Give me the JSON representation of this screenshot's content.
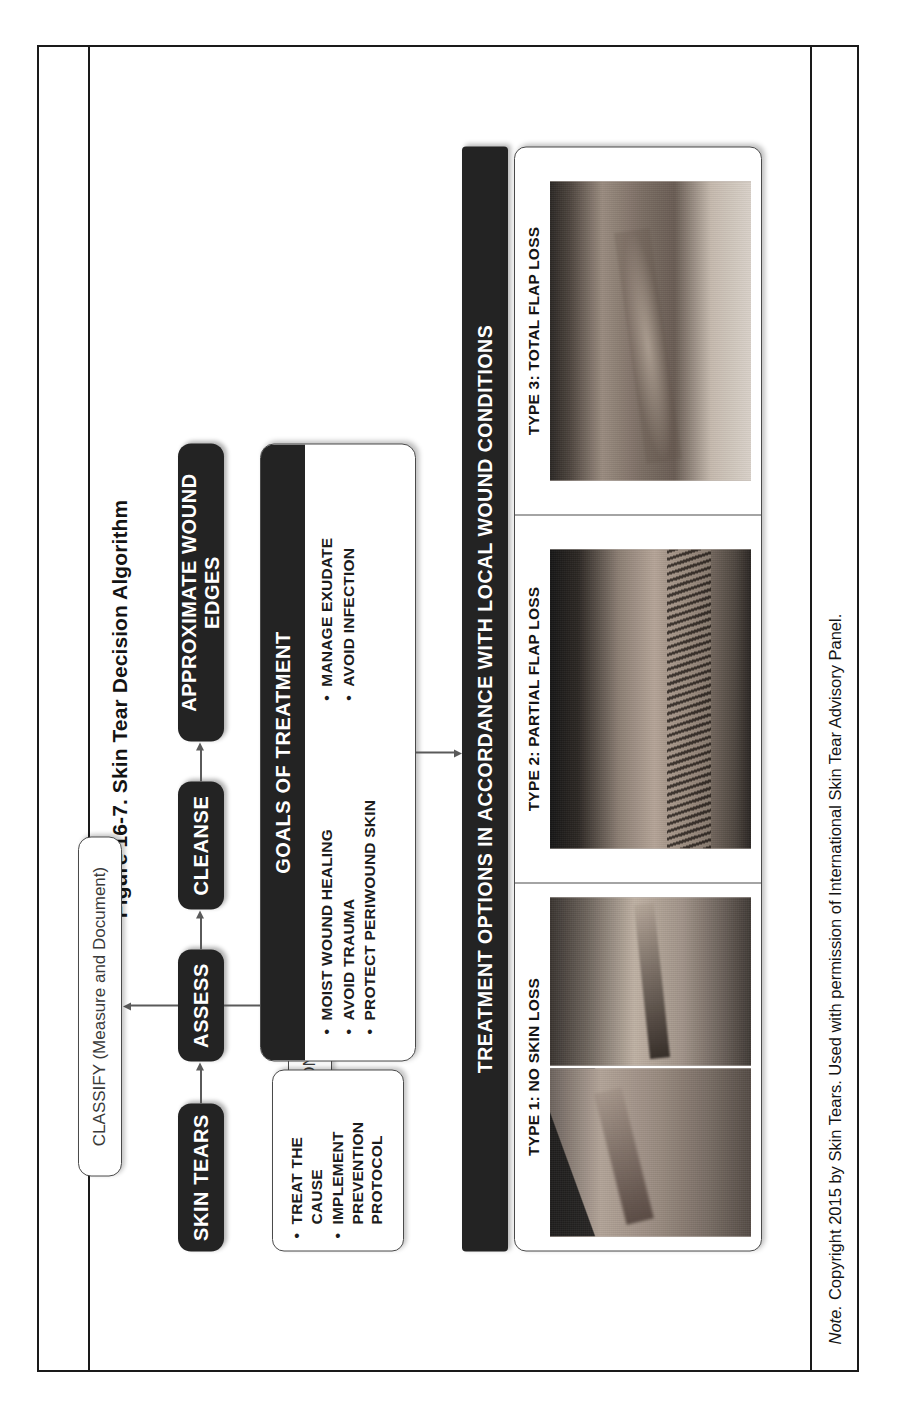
{
  "figure": {
    "title": "Figure 16-7. Skin Tear Decision Algorithm",
    "note_label": "Note.",
    "note_text": "Copyright 2015 by Skin Tears. Used with permission of International Skin Tear Advisory Panel."
  },
  "flow": {
    "start": {
      "label": "SKIN TEARS",
      "style": "dark"
    },
    "assess": {
      "label": "ASSESS",
      "style": "dark"
    },
    "control_bleeding": {
      "label": "CONTROL BLEEDING",
      "style": "light"
    },
    "classify": {
      "label": "CLASSIFY (Measure and Document)",
      "style": "light"
    },
    "cleanse": {
      "label": "CLEANSE",
      "style": "dark"
    },
    "approximate": {
      "label": "APPROXIMATE WOUND EDGES",
      "style": "dark"
    }
  },
  "goals": {
    "header": "GOALS OF TREATMENT",
    "column_left": [
      {
        "bullet": "•",
        "text": "MOIST WOUND HEALING"
      },
      {
        "bullet": "•",
        "text": "AVOID TRAUMA"
      },
      {
        "bullet": "•",
        "text": "PROTECT PERIWOUND SKIN"
      }
    ],
    "column_right": [
      {
        "bullet": "•",
        "text": "MANAGE EXUDATE"
      },
      {
        "bullet": "•",
        "text": "AVOID INFECTION"
      }
    ]
  },
  "cause": {
    "items": [
      {
        "bullet": "•",
        "text": "TREAT THE CAUSE"
      },
      {
        "bullet": "•",
        "text": "IMPLEMENT PREVENTION",
        "continuation": "PROTOCOL"
      }
    ]
  },
  "treatment": {
    "header": "TREATMENT OPTIONS IN ACCORDANCE WITH LOCAL WOUND CONDITIONS",
    "types": [
      {
        "label": "TYPE 1: NO SKIN LOSS",
        "photo_count": 2
      },
      {
        "label": "TYPE 2: PARTIAL FLAP LOSS",
        "photo_count": 1
      },
      {
        "label": "TYPE 3: TOTAL FLAP LOSS",
        "photo_count": 1
      }
    ]
  },
  "colors": {
    "node_dark": "#232323",
    "node_dark_text": "#ffffff",
    "node_light_border": "#4a4a4a",
    "node_light_text": "#3a3a3a",
    "frame": "#1a1a1a",
    "arrow": "#5a5a5a"
  }
}
